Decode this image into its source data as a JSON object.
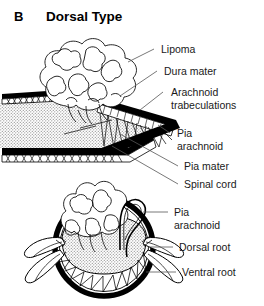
{
  "figure": {
    "panel_letter": "B",
    "title": "Dorsal Type",
    "background_color": "#ffffff",
    "ink_color": "#000000",
    "leader_color": "#555555",
    "cord_fill_color": "#d9d9d9"
  },
  "labels": {
    "lipoma": "Lipoma",
    "dura_mater": "Dura mater",
    "arachnoid_line1": "Arachnoid",
    "arachnoid_line2": "trabeculations",
    "pia_arachnoid_upper_line1": "Pia",
    "pia_arachnoid_upper_line2": "arachnoid",
    "pia_mater": "Pia mater",
    "spinal_cord": "Spinal cord",
    "pia_arachnoid_lower_line1": "Pia",
    "pia_arachnoid_lower_line2": "arachnoid",
    "dorsal_root": "Dorsal root",
    "ventral_root": "Ventral root"
  },
  "structures": {
    "upper_view": "longitudinal cut-away of dorsal spinal cord with exophytic lipoma",
    "lower_view": "axial cross-section of spinal cord with dorsal lipoma and nerve roots"
  }
}
